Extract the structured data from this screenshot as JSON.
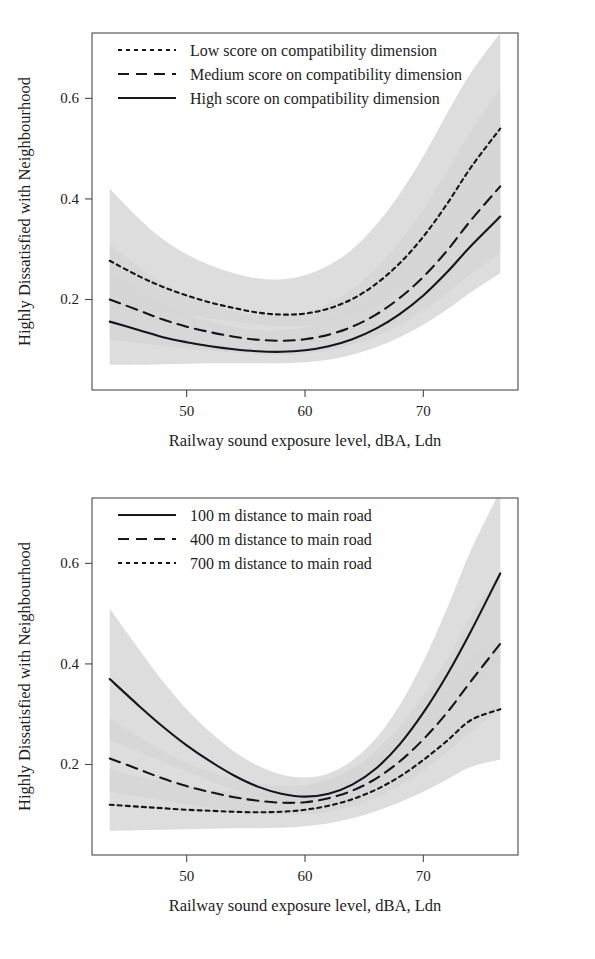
{
  "figure": {
    "panel_count": 2,
    "colors": {
      "line": "#15151a",
      "band": "#d6d6d6",
      "axis": "#4a4a4a",
      "text": "#1d1d1d"
    }
  },
  "chart_data": [
    {
      "id": "panel-1",
      "type": "line",
      "title": "",
      "xlabel": "Railway sound exposure level, dBA, Ldn",
      "ylabel": "Highly Dissatisfied with Neighbourhood",
      "xlim": [
        42.0,
        78.0
      ],
      "ylim": [
        0.02,
        0.73
      ],
      "xticks": [
        50,
        60,
        70
      ],
      "xticklabels": [
        "50",
        "60",
        "70"
      ],
      "yticks": [
        0.2,
        0.4,
        0.6
      ],
      "yticklabels": [
        "0.2",
        "0.4",
        "0.6"
      ],
      "grid": false,
      "legend_position": "top-left",
      "x": [
        43.5,
        46,
        48,
        50,
        52,
        54,
        56,
        58,
        60,
        62,
        64,
        66,
        68,
        70,
        72,
        74,
        76.5
      ],
      "series": [
        {
          "name": "Low score on compatibility dimension",
          "style": "dotted",
          "values": [
            0.277,
            0.246,
            0.225,
            0.208,
            0.194,
            0.183,
            0.174,
            0.17,
            0.172,
            0.182,
            0.201,
            0.231,
            0.272,
            0.325,
            0.39,
            0.462,
            0.54
          ],
          "band_lower": [
            0.188,
            0.18,
            0.174,
            0.168,
            0.162,
            0.156,
            0.15,
            0.147,
            0.148,
            0.155,
            0.168,
            0.188,
            0.215,
            0.248,
            0.287,
            0.33,
            0.378
          ],
          "band_upper": [
            0.42,
            0.36,
            0.32,
            0.29,
            0.268,
            0.252,
            0.242,
            0.24,
            0.248,
            0.268,
            0.3,
            0.348,
            0.41,
            0.485,
            0.57,
            0.65,
            0.73
          ]
        },
        {
          "name": "Medium score on compatibility dimension",
          "style": "dashed",
          "values": [
            0.2,
            0.178,
            0.16,
            0.146,
            0.135,
            0.126,
            0.12,
            0.118,
            0.121,
            0.13,
            0.146,
            0.17,
            0.203,
            0.245,
            0.297,
            0.357,
            0.425
          ],
          "band_lower": [
            0.12,
            0.113,
            0.108,
            0.103,
            0.098,
            0.094,
            0.091,
            0.09,
            0.092,
            0.098,
            0.11,
            0.127,
            0.15,
            0.178,
            0.212,
            0.25,
            0.292
          ],
          "band_upper": [
            0.31,
            0.265,
            0.232,
            0.208,
            0.19,
            0.177,
            0.169,
            0.168,
            0.175,
            0.192,
            0.22,
            0.262,
            0.315,
            0.38,
            0.455,
            0.535,
            0.62
          ]
        },
        {
          "name": "High score on compatibility dimension",
          "style": "solid",
          "values": [
            0.156,
            0.139,
            0.125,
            0.115,
            0.107,
            0.101,
            0.097,
            0.096,
            0.099,
            0.107,
            0.121,
            0.142,
            0.171,
            0.208,
            0.254,
            0.306,
            0.365
          ],
          "band_lower": [
            0.07,
            0.07,
            0.071,
            0.072,
            0.073,
            0.073,
            0.073,
            0.073,
            0.075,
            0.08,
            0.09,
            0.105,
            0.125,
            0.15,
            0.18,
            0.214,
            0.252
          ],
          "band_upper": [
            0.258,
            0.218,
            0.19,
            0.17,
            0.155,
            0.145,
            0.139,
            0.139,
            0.145,
            0.16,
            0.186,
            0.223,
            0.272,
            0.332,
            0.4,
            0.478,
            0.56
          ]
        }
      ],
      "legend": [
        {
          "label": "Low score on compatibility dimension",
          "style": "dotted"
        },
        {
          "label": "Medium score on compatibility dimension",
          "style": "dashed"
        },
        {
          "label": "High score on compatibility dimension",
          "style": "solid"
        }
      ]
    },
    {
      "id": "panel-2",
      "type": "line",
      "title": "",
      "xlabel": "Railway sound exposure level, dBA, Ldn",
      "ylabel": "Highly Dissatisfied with Neighbourhood",
      "xlim": [
        42.0,
        78.0
      ],
      "ylim": [
        0.02,
        0.73
      ],
      "xticks": [
        50,
        60,
        70
      ],
      "xticklabels": [
        "50",
        "60",
        "70"
      ],
      "yticks": [
        0.2,
        0.4,
        0.6
      ],
      "yticklabels": [
        "0.2",
        "0.4",
        "0.6"
      ],
      "grid": false,
      "legend_position": "top-left",
      "x": [
        43.5,
        46,
        48,
        50,
        52,
        54,
        56,
        58,
        60,
        62,
        64,
        66,
        68,
        70,
        72,
        74,
        76.5
      ],
      "series": [
        {
          "name": "100 m distance to main road",
          "style": "solid",
          "values": [
            0.37,
            0.316,
            0.275,
            0.238,
            0.206,
            0.178,
            0.156,
            0.142,
            0.136,
            0.142,
            0.16,
            0.192,
            0.24,
            0.303,
            0.378,
            0.464,
            0.58
          ],
          "band_lower": [
            0.248,
            0.225,
            0.205,
            0.186,
            0.167,
            0.15,
            0.135,
            0.124,
            0.119,
            0.122,
            0.134,
            0.156,
            0.188,
            0.23,
            0.28,
            0.338,
            0.405
          ],
          "band_upper": [
            0.51,
            0.428,
            0.365,
            0.31,
            0.264,
            0.226,
            0.198,
            0.18,
            0.174,
            0.182,
            0.208,
            0.252,
            0.318,
            0.405,
            0.51,
            0.625,
            0.745
          ]
        },
        {
          "name": "400 m distance to main road",
          "style": "dashed",
          "values": [
            0.212,
            0.19,
            0.172,
            0.157,
            0.145,
            0.135,
            0.128,
            0.124,
            0.125,
            0.133,
            0.148,
            0.172,
            0.206,
            0.25,
            0.303,
            0.365,
            0.44
          ],
          "band_lower": [
            0.145,
            0.136,
            0.128,
            0.121,
            0.114,
            0.108,
            0.103,
            0.1,
            0.101,
            0.106,
            0.117,
            0.134,
            0.158,
            0.188,
            0.224,
            0.264,
            0.31
          ],
          "band_upper": [
            0.292,
            0.254,
            0.226,
            0.203,
            0.185,
            0.171,
            0.161,
            0.157,
            0.159,
            0.17,
            0.192,
            0.227,
            0.276,
            0.337,
            0.41,
            0.492,
            0.585
          ]
        },
        {
          "name": "700 m distance to main road",
          "style": "dotted",
          "values": [
            0.12,
            0.116,
            0.113,
            0.11,
            0.108,
            0.106,
            0.105,
            0.106,
            0.11,
            0.118,
            0.131,
            0.15,
            0.176,
            0.209,
            0.247,
            0.288,
            0.31
          ],
          "band_lower": [
            0.068,
            0.069,
            0.07,
            0.071,
            0.072,
            0.073,
            0.073,
            0.074,
            0.077,
            0.083,
            0.093,
            0.107,
            0.125,
            0.146,
            0.17,
            0.195,
            0.21
          ],
          "band_upper": [
            0.19,
            0.176,
            0.166,
            0.157,
            0.15,
            0.145,
            0.143,
            0.146,
            0.154,
            0.168,
            0.189,
            0.218,
            0.256,
            0.302,
            0.356,
            0.415,
            0.452
          ]
        }
      ],
      "legend": [
        {
          "label": "100 m distance to main road",
          "style": "solid"
        },
        {
          "label": "400 m distance to main road",
          "style": "dashed"
        },
        {
          "label": "700 m distance to main road",
          "style": "dotted"
        }
      ]
    }
  ]
}
